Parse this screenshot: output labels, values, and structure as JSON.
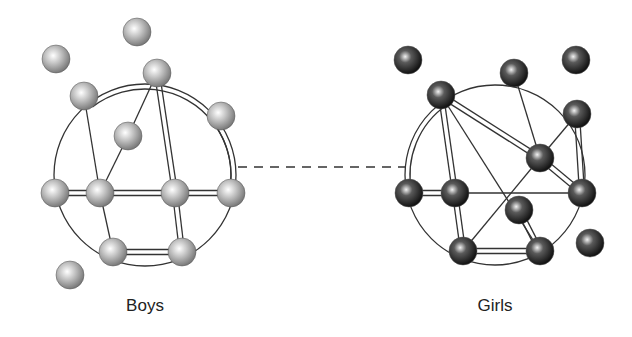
{
  "labels": {
    "left": "Boys",
    "right": "Girls"
  },
  "colors": {
    "boys_node": "#b8b8b8",
    "girls_node": "#3a3a3a",
    "line": "#333333"
  },
  "boys": {
    "circle": {
      "cx": 145,
      "cy": 175,
      "r": 91
    },
    "nodes": [
      {
        "id": "b1",
        "x": 56,
        "y": 59
      },
      {
        "id": "b2",
        "x": 137,
        "y": 32
      },
      {
        "id": "b3",
        "x": 84,
        "y": 96
      },
      {
        "id": "b4",
        "x": 157,
        "y": 73
      },
      {
        "id": "b5",
        "x": 221,
        "y": 116
      },
      {
        "id": "b6",
        "x": 128,
        "y": 136
      },
      {
        "id": "b7",
        "x": 55,
        "y": 193
      },
      {
        "id": "b8",
        "x": 100,
        "y": 193
      },
      {
        "id": "b9",
        "x": 175,
        "y": 193
      },
      {
        "id": "b10",
        "x": 231,
        "y": 193
      },
      {
        "id": "b11",
        "x": 113,
        "y": 252
      },
      {
        "id": "b12",
        "x": 182,
        "y": 252
      },
      {
        "id": "b13",
        "x": 70,
        "y": 275
      }
    ],
    "single_edges": [
      [
        "b3",
        "b8"
      ],
      [
        "b4",
        "b6"
      ],
      [
        "b6",
        "b8"
      ],
      [
        "b8",
        "b11"
      ]
    ],
    "double_edges": [
      [
        "b3",
        "b4"
      ],
      [
        "b4",
        "b9"
      ],
      [
        "b4",
        "b10"
      ],
      [
        "b5",
        "b10"
      ],
      [
        "b7",
        "b8"
      ],
      [
        "b8",
        "b9"
      ],
      [
        "b9",
        "b10"
      ],
      [
        "b9",
        "b12"
      ],
      [
        "b11",
        "b12"
      ]
    ],
    "arc_edges": [
      [
        "b3",
        "b7"
      ],
      [
        "b4",
        "b5"
      ],
      [
        "b7",
        "b11"
      ],
      [
        "b10",
        "b12"
      ]
    ]
  },
  "girls": {
    "circle": {
      "cx": 495,
      "cy": 175,
      "r": 90
    },
    "nodes": [
      {
        "id": "g1",
        "x": 408,
        "y": 60
      },
      {
        "id": "g2",
        "x": 576,
        "y": 60
      },
      {
        "id": "g3",
        "x": 441,
        "y": 95
      },
      {
        "id": "g4",
        "x": 514,
        "y": 73
      },
      {
        "id": "g5",
        "x": 577,
        "y": 114
      },
      {
        "id": "g6",
        "x": 540,
        "y": 158
      },
      {
        "id": "g7",
        "x": 409,
        "y": 193
      },
      {
        "id": "g8",
        "x": 455,
        "y": 193
      },
      {
        "id": "g9",
        "x": 582,
        "y": 193
      },
      {
        "id": "g10",
        "x": 519,
        "y": 210
      },
      {
        "id": "g11",
        "x": 463,
        "y": 251
      },
      {
        "id": "g12",
        "x": 540,
        "y": 251
      },
      {
        "id": "g13",
        "x": 590,
        "y": 243
      }
    ],
    "single_edges": [
      [
        "g3",
        "g12"
      ],
      [
        "g4",
        "g6"
      ],
      [
        "g5",
        "g6"
      ],
      [
        "g6",
        "g11"
      ],
      [
        "g8",
        "g9"
      ]
    ],
    "double_edges": [
      [
        "g3",
        "g7"
      ],
      [
        "g3",
        "g8"
      ],
      [
        "g3",
        "g6"
      ],
      [
        "g6",
        "g9"
      ],
      [
        "g5",
        "g9"
      ],
      [
        "g7",
        "g8"
      ],
      [
        "g8",
        "g11"
      ],
      [
        "g10",
        "g12"
      ],
      [
        "g11",
        "g12"
      ]
    ],
    "arc_edges": [
      [
        "g3",
        "g4"
      ],
      [
        "g4",
        "g5"
      ],
      [
        "g7",
        "g11"
      ],
      [
        "g9",
        "g12"
      ]
    ]
  },
  "bridge": {
    "x1": 238,
    "y1": 167,
    "x2": 405,
    "y2": 167,
    "style": "dashed"
  }
}
